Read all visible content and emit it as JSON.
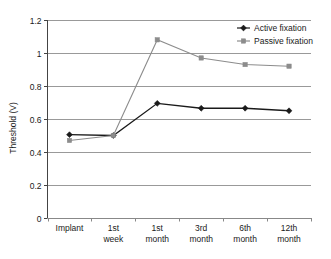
{
  "chart_data": {
    "type": "line",
    "title": "",
    "xlabel": "",
    "ylabel": "Threshold (V)",
    "categories": [
      "Implant",
      "1st week",
      "1st month",
      "3rd month",
      "6th month",
      "12th month"
    ],
    "category_lines": [
      [
        "Implant"
      ],
      [
        "1st",
        "week"
      ],
      [
        "1st",
        "month"
      ],
      [
        "3rd",
        "month"
      ],
      [
        "6th",
        "month"
      ],
      [
        "12th",
        "month"
      ]
    ],
    "series": [
      {
        "name": "Active fixation",
        "marker": "diamond",
        "color": "#1a1a1a",
        "values": [
          0.505,
          0.5,
          0.695,
          0.665,
          0.665,
          0.65
        ]
      },
      {
        "name": "Passive fixation",
        "marker": "square",
        "color": "#8c8c8c",
        "values": [
          0.47,
          0.5,
          1.08,
          0.97,
          0.93,
          0.92
        ]
      }
    ],
    "ylim": [
      0,
      1.2
    ],
    "ytick_values": [
      0,
      0.2,
      0.4,
      0.6,
      0.8,
      1.0,
      1.2
    ],
    "ytick_labels": [
      "0",
      "0.2",
      "0.4",
      "0.6",
      "0.8",
      "1",
      "1.2"
    ],
    "grid": true,
    "grid_axis": "y",
    "grid_color": "#999999",
    "legend_position": "top-right",
    "legend": [
      {
        "label": "Active fixation",
        "marker": "diamond",
        "color": "#1a1a1a"
      },
      {
        "label": "Passive fixation",
        "marker": "square",
        "color": "#8c8c8c"
      }
    ],
    "axis_color": "#444444",
    "background": "#ffffff"
  }
}
